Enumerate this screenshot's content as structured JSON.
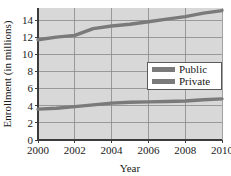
{
  "chart_data": {
    "type": "line",
    "title": "",
    "xlabel": "Year",
    "ylabel": "Enrollment (in millions)",
    "xlim": [
      2000,
      2010
    ],
    "ylim": [
      0,
      15.4
    ],
    "xticks": [
      "2000",
      "2002",
      "2004",
      "2006",
      "2008",
      "2010"
    ],
    "xtick_values": [
      2000,
      2002,
      2004,
      2006,
      2008,
      2010
    ],
    "yticks": [
      "0",
      "2",
      "4",
      "6",
      "8",
      "10",
      "12",
      "14"
    ],
    "ytick_values": [
      0,
      2,
      4,
      6,
      8,
      10,
      12,
      14
    ],
    "grid": true,
    "legend_position": "center-right",
    "x": [
      2000,
      2001,
      2002,
      2003,
      2004,
      2005,
      2006,
      2007,
      2008,
      2009,
      2010
    ],
    "series": [
      {
        "name": "Public",
        "color": "#7a7a7a",
        "values": [
          11.7,
          12.0,
          12.2,
          13.0,
          13.3,
          13.5,
          13.8,
          14.1,
          14.4,
          14.8,
          15.1
        ]
      },
      {
        "name": "Private",
        "color": "#7a7a7a",
        "values": [
          3.6,
          3.7,
          3.9,
          4.1,
          4.3,
          4.4,
          4.45,
          4.5,
          4.55,
          4.7,
          4.8
        ]
      }
    ],
    "colors": {
      "plot_background": "#d8d8d8",
      "gridline": "#8a8a8a",
      "axis": "#3b3b3b",
      "page_background": "#ffffff"
    }
  },
  "legend": {
    "entries": [
      {
        "label": "Public"
      },
      {
        "label": "Private"
      }
    ]
  }
}
